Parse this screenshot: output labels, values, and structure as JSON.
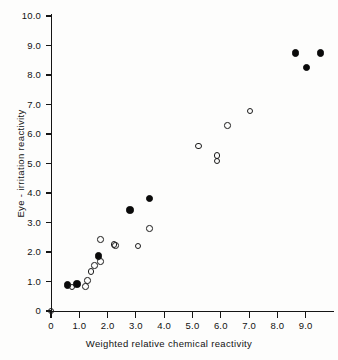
{
  "chart_data": {
    "type": "scatter",
    "title": "",
    "xlabel": "Weighted  relative  chemical  reactivity",
    "ylabel": "Eye - irritation reactivity",
    "xlim": [
      0,
      10
    ],
    "ylim": [
      0,
      10
    ],
    "grid": false,
    "legend": "none",
    "xticks": [
      "0",
      "1.0",
      "2.0",
      "3.0",
      "4.0",
      "5.0",
      "6.0",
      "7.0",
      "8.0",
      "9.0"
    ],
    "xtick_values": [
      0,
      1,
      2,
      3,
      4,
      5,
      6,
      7,
      8,
      9
    ],
    "yticks": [
      "0",
      "1.0",
      "2.0",
      "3.0",
      "4.0",
      "5.0",
      "6.0",
      "7.0",
      "8.0",
      "9.0",
      "10.0"
    ],
    "ytick_values": [
      0,
      1,
      2,
      3,
      4,
      5,
      6,
      7,
      8,
      9,
      10
    ],
    "series": [
      {
        "name": "filled-circles",
        "marker": "filled-circle",
        "color": "#0a0a0a",
        "points": [
          {
            "x": 0.58,
            "y": 0.88
          },
          {
            "x": 0.92,
            "y": 0.92
          },
          {
            "x": 1.67,
            "y": 1.86
          },
          {
            "x": 2.79,
            "y": 3.42
          },
          {
            "x": 3.47,
            "y": 3.82
          },
          {
            "x": 8.65,
            "y": 8.74
          },
          {
            "x": 9.02,
            "y": 8.25
          },
          {
            "x": 9.52,
            "y": 8.74
          }
        ]
      },
      {
        "name": "open-circles",
        "marker": "open-circle",
        "color": "#1a1a1a",
        "points": [
          {
            "x": 0.0,
            "y": 0.0
          },
          {
            "x": 0.74,
            "y": 0.82
          },
          {
            "x": 1.22,
            "y": 0.84
          },
          {
            "x": 1.28,
            "y": 1.03
          },
          {
            "x": 1.42,
            "y": 1.34
          },
          {
            "x": 1.53,
            "y": 1.55
          },
          {
            "x": 1.74,
            "y": 1.68
          },
          {
            "x": 1.74,
            "y": 2.42
          },
          {
            "x": 2.22,
            "y": 2.25
          },
          {
            "x": 2.27,
            "y": 2.22
          },
          {
            "x": 3.08,
            "y": 2.2
          },
          {
            "x": 3.48,
            "y": 2.8
          },
          {
            "x": 5.22,
            "y": 5.6
          },
          {
            "x": 5.86,
            "y": 5.28
          },
          {
            "x": 5.86,
            "y": 5.08
          },
          {
            "x": 6.24,
            "y": 6.28
          },
          {
            "x": 7.03,
            "y": 6.78
          }
        ]
      }
    ]
  },
  "axis_geometry": {
    "origin_x_px": 51,
    "origin_y_px": 311,
    "px_per_x_unit": 28.3,
    "px_per_y_unit": 29.5
  }
}
